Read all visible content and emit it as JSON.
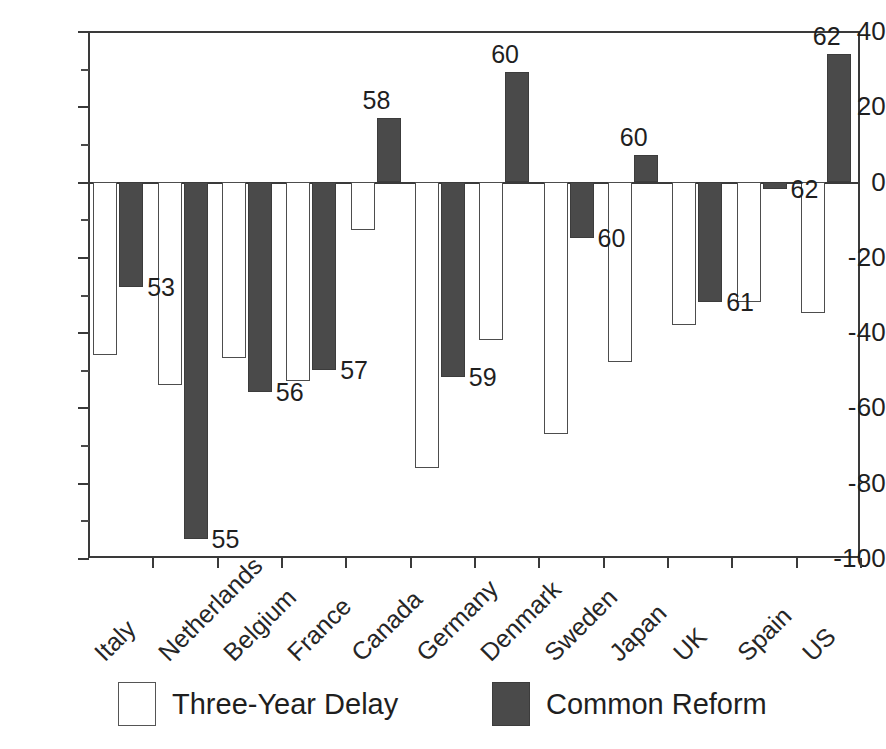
{
  "chart_data": {
    "type": "bar",
    "title": "",
    "xlabel": "",
    "ylabel": "",
    "ylim": [
      -100,
      40
    ],
    "grid": false,
    "legend_position": "bottom",
    "categories": [
      "Italy",
      "Netherlands",
      "Belgium",
      "France",
      "Canada",
      "Germany",
      "Denmark",
      "Sweden",
      "Japan",
      "UK",
      "Spain",
      "US"
    ],
    "ytick_labels": [
      "40",
      "20",
      "0",
      "-20",
      "-40",
      "-60",
      "-80",
      "-100"
    ],
    "ytick_values": [
      40,
      20,
      0,
      -20,
      -40,
      -60,
      -80,
      -100
    ],
    "minor_ticks": [
      30,
      10,
      -10,
      -30,
      -50,
      -70,
      -90
    ],
    "series": [
      {
        "name": "Three-Year Delay",
        "fill": "#ffffff",
        "values": [
          -46,
          -54,
          -47,
          -53,
          -13,
          -76,
          -42,
          -67,
          -48,
          -38,
          -32,
          -35
        ]
      },
      {
        "name": "Common Reform",
        "fill": "#4a4a4a",
        "values": [
          -28,
          -95,
          -56,
          -50,
          17,
          -52,
          29,
          -15,
          7,
          -32,
          -2,
          34
        ]
      }
    ],
    "point_labels": [
      {
        "text": "53",
        "series": "Common Reform",
        "category": "Italy"
      },
      {
        "text": "55",
        "series": "Common Reform",
        "category": "Netherlands"
      },
      {
        "text": "56",
        "series": "Common Reform",
        "category": "Belgium"
      },
      {
        "text": "57",
        "series": "Common Reform",
        "category": "France"
      },
      {
        "text": "58",
        "series": "Common Reform",
        "category": "Canada"
      },
      {
        "text": "59",
        "series": "Common Reform",
        "category": "Germany"
      },
      {
        "text": "60",
        "series": "Common Reform",
        "category": "Denmark"
      },
      {
        "text": "60",
        "series": "Common Reform",
        "category": "Sweden"
      },
      {
        "text": "60",
        "series": "Common Reform",
        "category": "Japan"
      },
      {
        "text": "61",
        "series": "Common Reform",
        "category": "UK"
      },
      {
        "text": "62",
        "series": "Common Reform",
        "category": "Spain"
      },
      {
        "text": "62",
        "series": "Common Reform",
        "category": "US"
      }
    ]
  },
  "axis": {
    "ticks": [
      {
        "label": "40"
      },
      {
        "label": "20"
      },
      {
        "label": "0"
      },
      {
        "label": "-20"
      },
      {
        "label": "-40"
      },
      {
        "label": "-60"
      },
      {
        "label": "-80"
      },
      {
        "label": "-100"
      }
    ]
  },
  "categories": [
    {
      "label": "Italy"
    },
    {
      "label": "Netherlands"
    },
    {
      "label": "Belgium"
    },
    {
      "label": "France"
    },
    {
      "label": "Canada"
    },
    {
      "label": "Germany"
    },
    {
      "label": "Denmark"
    },
    {
      "label": "Sweden"
    },
    {
      "label": "Japan"
    },
    {
      "label": "UK"
    },
    {
      "label": "Spain"
    },
    {
      "label": "US"
    }
  ],
  "value_labels": [
    {
      "text": "53"
    },
    {
      "text": "55"
    },
    {
      "text": "56"
    },
    {
      "text": "57"
    },
    {
      "text": "58"
    },
    {
      "text": "59"
    },
    {
      "text": "60"
    },
    {
      "text": "60"
    },
    {
      "text": "60"
    },
    {
      "text": "61"
    },
    {
      "text": "62"
    },
    {
      "text": "62"
    }
  ],
  "legend": {
    "items": [
      {
        "label": "Three-Year Delay",
        "swatch": "delay"
      },
      {
        "label": "Common Reform",
        "swatch": "reform"
      }
    ]
  },
  "colors": {
    "reform_fill": "#4a4a4a",
    "delay_fill": "#ffffff",
    "axis": "#3a3a3a",
    "text": "#1f1f1f"
  }
}
